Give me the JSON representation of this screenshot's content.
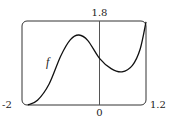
{
  "chart_data": {
    "type": "line",
    "title": "",
    "xlabel": "",
    "ylabel": "",
    "xlim": [
      -2,
      1.2
    ],
    "ylim": [
      0,
      1.8
    ],
    "grid": false,
    "tick_labels": {
      "x_left": "-2",
      "x_right": "1.2",
      "x_origin": "0",
      "y_top": "1.8"
    },
    "series": [
      {
        "name": "f",
        "x": [
          -1.85,
          -1.6,
          -1.3,
          -1.0,
          -0.75,
          -0.53,
          -0.3,
          0.0,
          0.3,
          0.58,
          0.85,
          1.05,
          1.2
        ],
        "y": [
          0.0,
          0.1,
          0.45,
          1.05,
          1.4,
          1.5,
          1.38,
          1.0,
          0.78,
          0.71,
          0.85,
          1.2,
          1.78
        ]
      }
    ],
    "annotations": [
      {
        "text": "f",
        "x": -1.3,
        "y": 0.92
      }
    ]
  }
}
